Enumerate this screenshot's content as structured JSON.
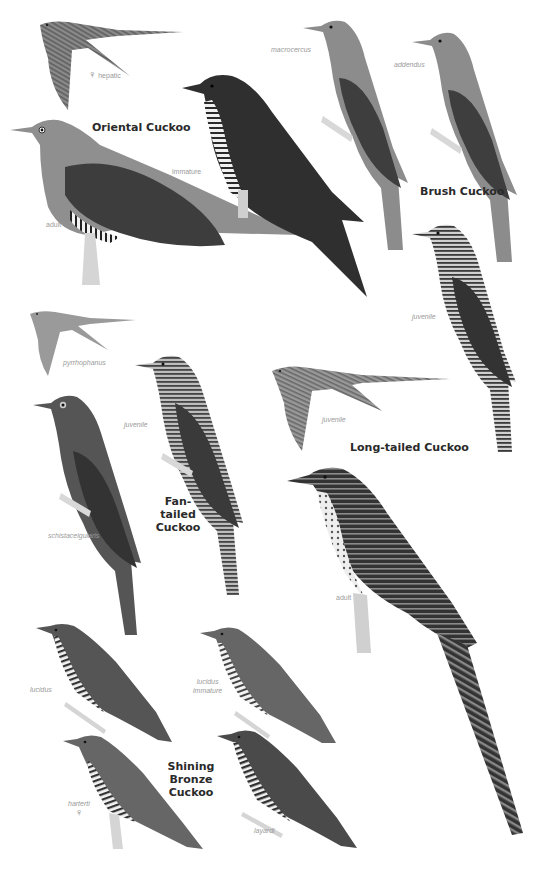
{
  "plate": {
    "species": [
      {
        "name": "Oriental Cuckoo",
        "figures": [
          {
            "label": "hepatic",
            "symbol": "♀",
            "pose": "flight"
          },
          {
            "label": "adult",
            "pose": "perched"
          },
          {
            "label": "immature",
            "pose": "perched"
          }
        ]
      },
      {
        "name": "Brush Cuckoo",
        "figures": [
          {
            "label": "macrocercus",
            "pose": "perched"
          },
          {
            "label": "addendus",
            "pose": "perched"
          },
          {
            "label": "juvenile",
            "pose": "perched"
          }
        ]
      },
      {
        "name_line1": "Fan-tailed",
        "name_line2": "Cuckoo",
        "figures": [
          {
            "label": "pyrrhophanus",
            "pose": "flight"
          },
          {
            "label": "schistaceigularis",
            "pose": "perched"
          },
          {
            "label": "juvenile",
            "pose": "perched"
          }
        ]
      },
      {
        "name": "Long-tailed Cuckoo",
        "figures": [
          {
            "label": "juvenile",
            "pose": "flight"
          },
          {
            "label": "adult",
            "pose": "perched"
          }
        ]
      },
      {
        "name_line1": "Shining Bronze",
        "name_line2": "Cuckoo",
        "figures": [
          {
            "label": "lucidus",
            "pose": "perched"
          },
          {
            "label_line1": "lucidus",
            "label_line2": "immature",
            "pose": "perched"
          },
          {
            "label": "harterti",
            "symbol": "♀",
            "pose": "perched"
          },
          {
            "label": "layardi",
            "pose": "perched"
          }
        ]
      }
    ]
  }
}
